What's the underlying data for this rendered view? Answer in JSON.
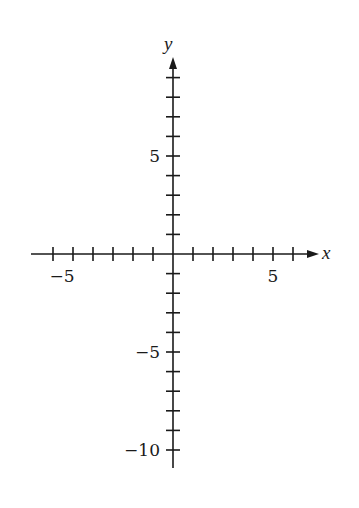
{
  "chart_data": {
    "type": "line",
    "title": "",
    "xlabel": "x",
    "ylabel": "y",
    "xlim": [
      -6,
      7.2
    ],
    "ylim": [
      -11,
      10
    ],
    "grid": false,
    "legend": null,
    "x_ticks": [
      -6,
      -5,
      -4,
      -3,
      -2,
      -1,
      1,
      2,
      3,
      4,
      5,
      6
    ],
    "y_ticks": [
      9,
      8,
      7,
      6,
      5,
      4,
      3,
      2,
      1,
      -1,
      -2,
      -3,
      -4,
      -5,
      -6,
      -7,
      -8,
      -9,
      -10
    ],
    "x_tick_labels": [
      {
        "value": -5,
        "text": "−5"
      },
      {
        "value": 5,
        "text": "5"
      }
    ],
    "y_tick_labels": [
      {
        "value": 5,
        "text": "5"
      },
      {
        "value": -5,
        "text": "−5"
      },
      {
        "value": -10,
        "text": "−10"
      }
    ],
    "arrows": {
      "x_positive": true,
      "y_positive": true
    },
    "series": []
  },
  "labels": {
    "x_axis": "x",
    "y_axis": "y",
    "x_neg5": "−5",
    "x_pos5": "5",
    "y_pos5": "5",
    "y_neg5": "−5",
    "y_neg10": "−10"
  },
  "colors": {
    "ink": "#1a1a1a",
    "background": "#ffffff"
  }
}
